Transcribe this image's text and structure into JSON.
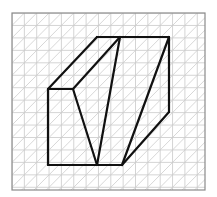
{
  "figure": {
    "grid": {
      "x0": 12,
      "y0": 13,
      "x1": 205,
      "y1": 190,
      "cell_w": 12.35,
      "cell_h": 12.45,
      "line_color": "#c9c9c9",
      "border_color": "#8a8a8a"
    },
    "edge_color": "#111111",
    "vertices": {
      "A": [
        48,
        89
      ],
      "B": [
        73,
        89
      ],
      "C": [
        97,
        37
      ],
      "D": [
        120,
        37
      ],
      "E": [
        169,
        37
      ],
      "F": [
        169,
        112
      ],
      "G": [
        122,
        165
      ],
      "H": [
        97,
        165
      ],
      "I": [
        48,
        165
      ]
    },
    "edges": [
      [
        "A",
        "C"
      ],
      [
        "C",
        "E"
      ],
      [
        "E",
        "F"
      ],
      [
        "F",
        "G"
      ],
      [
        "G",
        "I"
      ],
      [
        "I",
        "A"
      ],
      [
        "A",
        "B"
      ],
      [
        "B",
        "D"
      ],
      [
        "B",
        "H"
      ],
      [
        "D",
        "H"
      ],
      [
        "E",
        "G"
      ]
    ]
  }
}
